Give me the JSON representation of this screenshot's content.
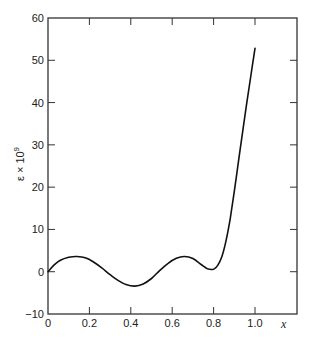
{
  "chart_data": {
    "type": "line",
    "title": "",
    "xlabel": "x",
    "ylabel": "ε × 10⁹",
    "ylabel_base": "ε × 10",
    "ylabel_exp": "9",
    "xlim": [
      0,
      1.16
    ],
    "ylim": [
      -10,
      60
    ],
    "grid": false,
    "legend": null,
    "x_ticks": [
      0,
      0.2,
      0.4,
      0.6,
      0.8,
      1.0
    ],
    "x_tick_labels": [
      "0",
      "0.2",
      "0.4",
      "0.6",
      "0.8",
      "1.0"
    ],
    "y_ticks": [
      -10,
      0,
      10,
      20,
      30,
      40,
      50,
      60
    ],
    "y_tick_labels": [
      "−10",
      "0",
      "10",
      "20",
      "30",
      "40",
      "50",
      "60"
    ],
    "series": [
      {
        "name": "ε",
        "color": "#111111",
        "x": [
          0.0,
          0.03,
          0.06,
          0.1,
          0.14,
          0.18,
          0.22,
          0.26,
          0.3,
          0.34,
          0.38,
          0.42,
          0.46,
          0.5,
          0.54,
          0.58,
          0.62,
          0.66,
          0.7,
          0.74,
          0.77,
          0.8,
          0.82,
          0.84,
          0.86,
          0.88,
          0.9,
          0.92,
          0.94,
          0.96,
          0.98,
          1.0
        ],
        "y": [
          0.0,
          1.6,
          2.7,
          3.4,
          3.6,
          3.3,
          2.3,
          0.9,
          -0.7,
          -2.1,
          -3.1,
          -3.4,
          -2.9,
          -1.6,
          0.3,
          2.0,
          3.2,
          3.6,
          3.1,
          1.7,
          0.7,
          0.6,
          1.5,
          3.6,
          7.3,
          12.5,
          19.0,
          26.0,
          33.0,
          39.8,
          46.4,
          52.8
        ]
      }
    ]
  }
}
